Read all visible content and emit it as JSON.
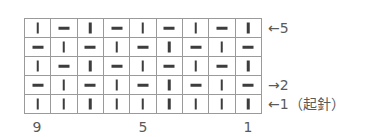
{
  "chart": {
    "columns": 9,
    "rows": [
      {
        "row": 5,
        "cells": [
          "knit",
          "purl",
          "knit",
          "purl",
          "knit",
          "purl",
          "knit",
          "purl",
          "knit"
        ]
      },
      {
        "row": 4,
        "cells": [
          "purl",
          "knit",
          "purl",
          "knit",
          "purl",
          "knit",
          "purl",
          "knit",
          "purl"
        ]
      },
      {
        "row": 3,
        "cells": [
          "knit",
          "purl",
          "knit",
          "purl",
          "knit",
          "purl",
          "knit",
          "purl",
          "knit"
        ]
      },
      {
        "row": 2,
        "cells": [
          "purl",
          "knit",
          "purl",
          "knit",
          "purl",
          "knit",
          "purl",
          "knit",
          "purl"
        ]
      },
      {
        "row": 1,
        "cells": [
          "knit",
          "knit",
          "knit",
          "knit",
          "knit",
          "knit",
          "knit",
          "knit",
          "knit"
        ]
      }
    ],
    "symbols": {
      "knit": "vertical-bar",
      "purl": "horizontal-bar"
    }
  },
  "row_labels": {
    "row5": "←5",
    "row2": "→2",
    "row1": "←1（起針）"
  },
  "col_labels": {
    "c9": "9",
    "c5": "5",
    "c1": "1"
  }
}
